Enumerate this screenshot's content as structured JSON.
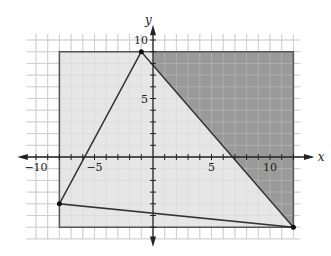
{
  "figure": {
    "x_axis_label": "x",
    "y_axis_label": "y",
    "x_tick_labels": [
      "-10",
      "-5",
      "5",
      "10"
    ],
    "y_tick_labels": [
      "10",
      "5"
    ],
    "colors": {
      "grid": "#cfcfcf",
      "rectangle_fill": "#e6e6e6",
      "dark_region_fill": "#9a9a9a",
      "line": "#333333"
    }
  },
  "chart_data": {
    "type": "diagram",
    "xlim": [
      -10,
      12
    ],
    "ylim": [
      -6,
      10
    ],
    "grid": true,
    "rectangle": {
      "x_min": -8,
      "x_max": 12,
      "y_min": -6,
      "y_max": 9
    },
    "triangle_vertices": [
      [
        -1,
        9
      ],
      [
        -8,
        -4
      ],
      [
        12,
        -6
      ]
    ],
    "dark_region_vertices": [
      [
        0,
        9
      ],
      [
        12,
        9
      ],
      [
        12,
        -6
      ],
      [
        0,
        7.85
      ]
    ],
    "x_ticks": [
      -10,
      -5,
      5,
      10
    ],
    "y_ticks": [
      10,
      5
    ],
    "xlabel": "x",
    "ylabel": "y"
  }
}
